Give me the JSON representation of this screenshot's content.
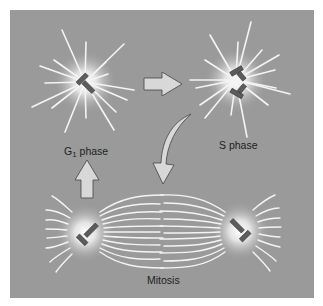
{
  "figure": {
    "type": "diagram",
    "background_color": "#9a9a9a",
    "stages": [
      {
        "id": "g1",
        "label_main": "G",
        "label_sub": "1",
        "label_rest": " phase",
        "description": "Single centrosome with pair of centrioles, radiating microtubules"
      },
      {
        "id": "s",
        "label": "S phase",
        "description": "Centrosome with duplicated centriole pairs, radiating microtubules"
      },
      {
        "id": "mitosis",
        "label": "Mitosis",
        "description": "Two centrosomes at opposite poles forming a mitotic spindle"
      }
    ],
    "arrows": [
      {
        "from": "g1",
        "to": "s",
        "direction": "right"
      },
      {
        "from": "s",
        "to": "mitosis",
        "direction": "curved-down"
      },
      {
        "from": "mitosis",
        "to": "g1",
        "direction": "up"
      }
    ]
  }
}
